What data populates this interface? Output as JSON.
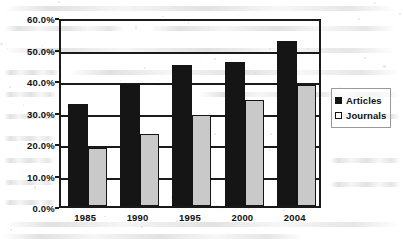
{
  "chart_data": {
    "type": "bar",
    "title": "",
    "subtitle": "",
    "xlabel": "",
    "ylabel": "",
    "categories": [
      "1985",
      "1990",
      "1995",
      "2000",
      "2004"
    ],
    "series": [
      {
        "name": "Articles",
        "values": [
          32.3,
          38.6,
          44.8,
          45.7,
          52.5
        ],
        "color": "#151515",
        "swatch": "filled"
      },
      {
        "name": "Journals",
        "values": [
          18.3,
          23.0,
          28.8,
          33.5,
          38.3
        ],
        "color": "#c9c9c9",
        "swatch": "open"
      }
    ],
    "ylim": [
      0,
      60
    ],
    "ytick_values": [
      60,
      50,
      40,
      30,
      20,
      10,
      0
    ],
    "ytick_labels": [
      "60.0%",
      "50.0%",
      "40.0%",
      "30.0%",
      "20.0%",
      "10.0%",
      "0.0%"
    ],
    "value_format": "percent",
    "grid": true,
    "grid_axis": "y",
    "legend_position": "right",
    "legend_entries": [
      "Articles",
      "Journals"
    ],
    "annotations": []
  },
  "colors": {
    "axis": "#1a1a1a",
    "text": "#111111",
    "articles": "#151515",
    "journals": "#c9c9c9",
    "background": "#ffffff",
    "legend_border": "#9a9a9a"
  }
}
